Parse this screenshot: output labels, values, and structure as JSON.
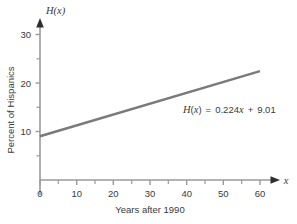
{
  "chart_data": {
    "type": "line",
    "title": "",
    "xlabel": "Years after 1990",
    "ylabel": "Percent of Hispanics",
    "y_axis_symbol": "H(x)",
    "x_axis_symbol": "x",
    "xlim": [
      0,
      64
    ],
    "ylim": [
      0,
      33
    ],
    "grid": false,
    "legend": null,
    "x_ticks": [
      0,
      10,
      20,
      30,
      40,
      50,
      60
    ],
    "x_tick_labels": [
      "0",
      "10",
      "20",
      "30",
      "40",
      "50",
      "60"
    ],
    "x_minor_ticks": [
      5,
      15,
      25,
      35,
      45,
      55
    ],
    "y_ticks": [
      10,
      20,
      30
    ],
    "y_tick_labels": [
      "10",
      "20",
      "30"
    ],
    "y_minor_ticks": [
      5,
      15,
      25
    ],
    "series": [
      {
        "name": "H(x) = 0.224x + 9.01",
        "slope": 0.224,
        "intercept": 9.01,
        "color": "#7a7a7a",
        "x": [
          0,
          60
        ],
        "values": [
          9.01,
          22.45
        ]
      }
    ],
    "annotations": [
      {
        "id": "equation",
        "text": "H(x) = 0.224x + 9.01",
        "parts": {
          "fn_h": "H",
          "fn_open": "(",
          "fn_var": "x",
          "fn_close": ")",
          "equals": "=",
          "coefficient": "0.224",
          "coef_var": "x",
          "plus": "+",
          "constant": "9.01"
        },
        "x": 39,
        "y": 15.2
      }
    ],
    "colors": {
      "line": "#7a7a7a",
      "axis": "#9a9a9a",
      "text": "#3a3a3a",
      "background": "#ffffff"
    }
  }
}
